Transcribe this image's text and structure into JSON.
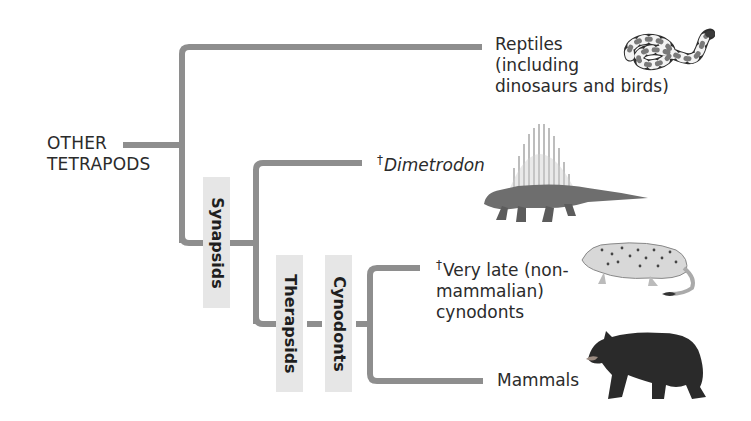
{
  "diagram": {
    "type": "phylogenetic-tree",
    "root": {
      "label_line1": "OTHER",
      "label_line2": "TETRAPODS"
    },
    "clades": [
      {
        "id": "synapsids",
        "label": "Synapsids"
      },
      {
        "id": "therapsids",
        "label": "Therapsids"
      },
      {
        "id": "cynodonts",
        "label": "Cynodonts"
      }
    ],
    "taxa": [
      {
        "id": "reptiles",
        "line1": "Reptiles",
        "line2": "(including",
        "line3": "dinosaurs and birds)",
        "extinct": false,
        "illustration": "snake"
      },
      {
        "id": "dimetrodon",
        "dagger": "†",
        "name": "Dimetrodon",
        "italic": true,
        "extinct": true,
        "illustration": "dimetrodon"
      },
      {
        "id": "late-cynodonts",
        "dagger": "†",
        "line1": "Very late (non-",
        "line2": "mammalian)",
        "line3": "cynodonts",
        "extinct": true,
        "illustration": "cynodont"
      },
      {
        "id": "mammals",
        "line1": "Mammals",
        "extinct": false,
        "illustration": "bear"
      }
    ],
    "colors": {
      "branch": "#8e8e8e",
      "clade_box": "#e6e6e6",
      "text": "#2b2b2b"
    }
  }
}
